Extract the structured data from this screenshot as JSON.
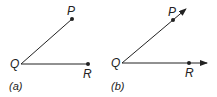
{
  "figures": [
    {
      "id": "a",
      "caption": "(a)",
      "type": "angle-segments",
      "vertex": {
        "label": "Q"
      },
      "points": [
        {
          "label": "P"
        },
        {
          "label": "R"
        }
      ],
      "description": "Line segments QP and QR forming an angle at Q"
    },
    {
      "id": "b",
      "caption": "(b)",
      "type": "angle-rays",
      "vertex": {
        "label": "Q"
      },
      "points": [
        {
          "label": "P"
        },
        {
          "label": "R"
        }
      ],
      "description": "Rays QP and QR forming an angle at Q"
    }
  ],
  "colors": {
    "stroke": "#222222"
  }
}
